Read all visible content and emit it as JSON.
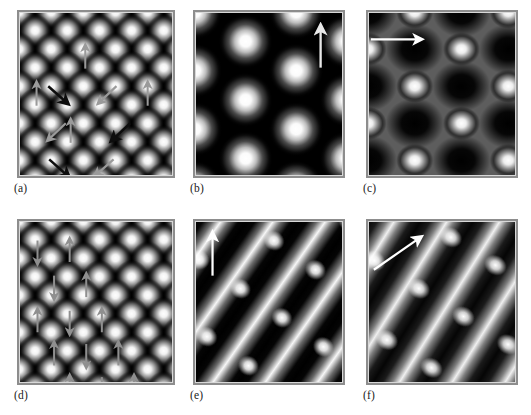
{
  "figure": {
    "panel_count": 6,
    "background_color": "#ffffff",
    "frame_color": "#8d8d8d",
    "image_background": "#000000",
    "spot_color": "#ffffff"
  },
  "panels": [
    {
      "id": "a",
      "label": "(a)",
      "pattern": "hexagonal-spot-lattice",
      "spot_rows": 5,
      "spot_cols": 5,
      "spot_spacing_px": 33,
      "arrow_style": "spin-arrows-multi-direction",
      "arrow_count": 11,
      "arrow_colors": [
        "#9a9a9a",
        "#111111"
      ],
      "arrow_directions_deg": [
        90,
        90,
        90,
        90,
        90,
        315,
        225,
        315,
        225,
        225,
        315
      ],
      "description": "Fine hexagonal lattice of bright spots with gray up arrows and black diagonal arrows forming a three-state 120 degree spin structure"
    },
    {
      "id": "b",
      "label": "(b)",
      "pattern": "hexagonal-spot-lattice-coarse",
      "spot_rows": 4,
      "spot_cols": 3,
      "spot_spacing_px": 52,
      "arrow_style": "single-reference-arrow",
      "arrow_count": 1,
      "arrow_colors": [
        "#e8e8e8"
      ],
      "arrow_directions_deg": [
        90
      ],
      "arrow_position": "top-right",
      "description": "Coarse hexagonal lattice of large bright spots with a single vertical reference arrow at top right"
    },
    {
      "id": "c",
      "label": "(c)",
      "pattern": "honeycomb-staggered-lattice",
      "spot_rows": 5,
      "spot_cols": 4,
      "spot_spacing_px": 48,
      "arrow_style": "single-reference-arrow",
      "arrow_count": 1,
      "arrow_colors": [
        "#ffffff"
      ],
      "arrow_directions_deg": [
        0
      ],
      "arrow_position": "top-left",
      "description": "Staggered honeycomb pattern with dark hexagonal voids and a horizontal reference arrow pointing right"
    },
    {
      "id": "d",
      "label": "(d)",
      "pattern": "hexagonal-spot-lattice",
      "spot_rows": 5,
      "spot_cols": 5,
      "spot_spacing_px": 33,
      "arrow_style": "spin-arrows-vertical-alternating",
      "arrow_count": 13,
      "arrow_colors": [
        "#8f8f8f"
      ],
      "arrow_directions_deg": [
        90,
        90,
        270,
        90,
        90,
        270,
        90,
        90,
        270,
        90,
        90,
        270,
        90
      ],
      "description": "Fine hexagonal lattice with vertical arrows alternating up and down indicating antiferromagnetic order"
    },
    {
      "id": "e",
      "label": "(e)",
      "pattern": "diagonal-stripes-with-spots",
      "stripe_angle_deg": -55,
      "stripe_period_px": 44,
      "arrow_style": "single-reference-arrow",
      "arrow_count": 1,
      "arrow_colors": [
        "#ffffff"
      ],
      "arrow_directions_deg": [
        90
      ],
      "arrow_position": "top-left",
      "description": "Bright diagonal stripes running upper-left to lower-right with embedded spots and a vertical reference arrow"
    },
    {
      "id": "f",
      "label": "(f)",
      "pattern": "diagonal-stripes-with-spots",
      "stripe_angle_deg": -58,
      "stripe_period_px": 46,
      "arrow_style": "single-reference-arrow",
      "arrow_count": 1,
      "arrow_colors": [
        "#ffffff"
      ],
      "arrow_directions_deg": [
        33
      ],
      "arrow_position": "top-left",
      "description": "Bright diagonal stripes with embedded spots and a diagonal reference arrow pointing up and to the right"
    }
  ]
}
